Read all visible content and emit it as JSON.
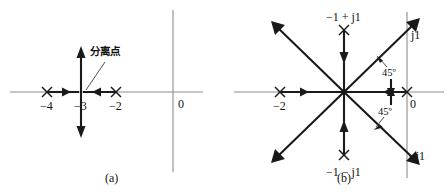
{
  "figure": {
    "type": "root-locus-diagram",
    "background_color": "#ffffff",
    "line_color": "#1a1a1a",
    "axis_color": "#8d8d8d",
    "panels": [
      {
        "id": "a",
        "caption": "(a)",
        "origin_label": "0",
        "breakaway_annotation": "分离点",
        "pole_labels": [
          "−4",
          "−3",
          "−2"
        ],
        "poles": [
          {
            "label": "−4",
            "re": -4,
            "im": 0
          },
          {
            "label": "−2",
            "re": -2,
            "im": 0
          }
        ],
        "breakaway_point": {
          "label": "−3",
          "re": -3,
          "im": 0
        }
      },
      {
        "id": "b",
        "caption": "(b)",
        "origin_label": "0",
        "pole_labels": [
          "−2",
          "−1 + j1",
          "−1 − j1",
          "j1",
          "−j1"
        ],
        "poles": [
          {
            "label": "−2",
            "re": -2,
            "im": 0
          },
          {
            "label": "−1 + j1",
            "re": -1,
            "im": 1
          },
          {
            "label": "−1 − j1",
            "re": -1,
            "im": -1
          },
          {
            "label": "0",
            "re": 0,
            "im": 0
          }
        ],
        "axis_labels": {
          "upper_imag": "j1",
          "lower_imag": "−j1",
          "origin": "0"
        },
        "angle_labels": [
          "45º",
          "45º"
        ],
        "asymptote_angle_deg": 45
      }
    ]
  }
}
